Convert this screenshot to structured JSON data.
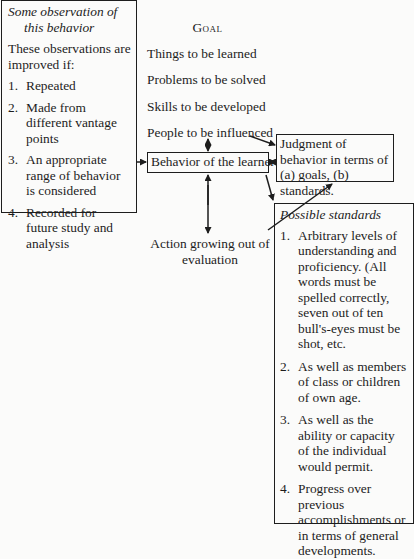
{
  "observation_box": {
    "title_line1": "Some observation of",
    "title_line2": "this behavior",
    "intro": "These observations are improved if:",
    "items": [
      {
        "num": "1.",
        "text": "Repeated"
      },
      {
        "num": "2.",
        "text": "Made from different vantage points"
      },
      {
        "num": "3.",
        "text": "An appropriate range of behavior is considered"
      },
      {
        "num": "4.",
        "text": "Recorded for future study and analysis"
      }
    ]
  },
  "goal": {
    "heading": "Goal",
    "items": [
      "Things to be learned",
      "Problems to be solved",
      "Skills to be developed",
      "People to be influenced"
    ]
  },
  "behavior_box": {
    "label": "Behavior of the learner"
  },
  "judgment_box": {
    "label": "Judgment of behavior in terms of (a) goals, (b) standards."
  },
  "action": {
    "label": "Action growing out of evaluation"
  },
  "standards_box": {
    "title": "Possible standards",
    "items": [
      {
        "num": "1.",
        "text": "Arbitrary levels of understanding and proficiency. (All words must be spelled correctly, seven out of ten bull's-eyes must be shot, etc."
      },
      {
        "num": "2.",
        "text": "As well as members of class or children of own age."
      },
      {
        "num": "3.",
        "text": "As well as the ability or capacity of the individual would permit."
      },
      {
        "num": "4.",
        "text": "Progress over previous accomplishments or in terms of general developments."
      }
    ]
  }
}
